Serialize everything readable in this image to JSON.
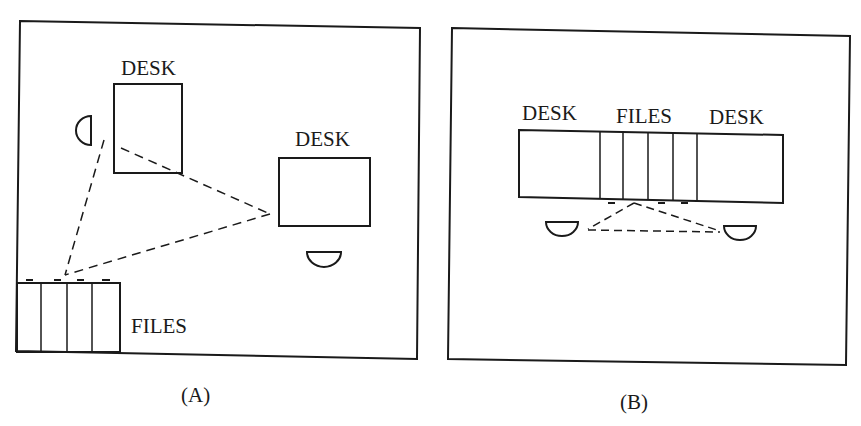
{
  "figure": {
    "panels": [
      {
        "id": "A",
        "caption": "(A)",
        "desks": [
          {
            "label": "DESK",
            "x": 114,
            "y": 84,
            "w": 68,
            "h": 89
          },
          {
            "label": "DESK",
            "x": 279,
            "y": 158,
            "w": 91,
            "h": 68
          }
        ],
        "files": {
          "label": "FILES",
          "x": 17,
          "y": 283,
          "w": 103,
          "h": 69,
          "drawers": 4
        },
        "chairs": 2,
        "path": "dashed triangle linking desk 1, desk 2 and files"
      },
      {
        "id": "B",
        "caption": "(B)",
        "desks": [
          {
            "label": "DESK"
          },
          {
            "label": "DESK"
          }
        ],
        "files": {
          "label": "FILES",
          "drawers": 4
        },
        "chairs": 2,
        "path": "dashed triangle linking the two chairs and files"
      }
    ],
    "colors": {
      "ink": "#1a1a1a",
      "background": "#ffffff"
    }
  }
}
